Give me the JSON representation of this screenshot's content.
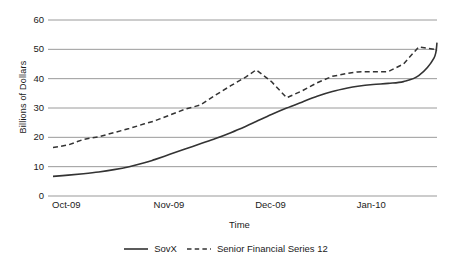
{
  "chart_data": {
    "type": "line",
    "title": "",
    "xlabel": "Time",
    "ylabel": "Billions of Dollars",
    "ylim": [
      0,
      60
    ],
    "yticks": [
      0,
      10,
      20,
      30,
      40,
      50,
      60
    ],
    "xticks": [
      "Oct-09",
      "Nov-09",
      "Dec-09",
      "Jan-10"
    ],
    "grid": "horizontal",
    "legend_position": "bottom-center",
    "series": [
      {
        "name": "SovX",
        "style": "solid",
        "color": "#333333",
        "x": [
          0,
          0.15,
          0.3,
          0.45,
          0.6,
          0.75,
          0.9,
          1.0,
          1.15,
          1.3,
          1.45,
          1.6,
          1.75,
          1.9,
          2.0,
          2.15,
          2.3,
          2.45,
          2.6,
          2.75,
          2.9,
          3.0,
          3.15,
          3.3,
          3.45,
          3.6,
          3.75
        ],
        "values": [
          6.7,
          7.1,
          7.6,
          8.2,
          9.0,
          10.0,
          11.3,
          12.4,
          14.2,
          16.0,
          17.8,
          19.6,
          21.6,
          23.8,
          25.4,
          27.8,
          30.0,
          32.0,
          34.0,
          35.6,
          36.8,
          37.4,
          38.0,
          38.4,
          39.0,
          41.0,
          47.0
        ],
        "final_value": 52.3
      },
      {
        "name": "Senior Financial Series 12",
        "style": "dashed",
        "color": "#333333",
        "x": [
          0,
          0.15,
          0.3,
          0.45,
          0.6,
          0.75,
          0.9,
          1.0,
          1.15,
          1.3,
          1.45,
          1.6,
          1.75,
          1.9,
          2.0,
          2.15,
          2.3,
          2.45,
          2.6,
          2.75,
          2.9,
          3.0,
          3.15,
          3.3,
          3.45,
          3.6,
          3.75
        ],
        "values": [
          16.5,
          17.4,
          19.3,
          20.2,
          21.6,
          23.0,
          24.6,
          25.6,
          27.6,
          29.6,
          31.0,
          34.4,
          37.6,
          40.6,
          43.0,
          39.0,
          33.5,
          35.8,
          38.6,
          40.8,
          41.8,
          42.3,
          42.4,
          42.4,
          45.0,
          50.8,
          50.0
        ],
        "final_value": 49.5
      }
    ],
    "annotations": {
      "sovx_peak": 52.3,
      "senior_peak": 51.0,
      "senior_dip": 33.5
    }
  },
  "axis": {
    "y_title": "Billions of Dollars",
    "x_title": "Time"
  },
  "legend": {
    "items": [
      {
        "label": "SovX",
        "dash": "solid"
      },
      {
        "label": "Senior Financial Series 12",
        "dash": "dashed"
      }
    ]
  }
}
